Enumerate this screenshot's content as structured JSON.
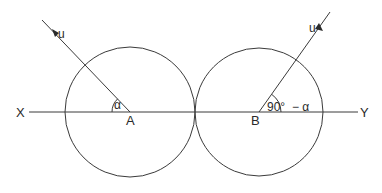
{
  "diagram": {
    "type": "geometry-projectile",
    "line_labels": {
      "left": "X",
      "right": "Y"
    },
    "points": {
      "A": {
        "label": "A",
        "x": 130,
        "y": 112
      },
      "B": {
        "label": "B",
        "x": 259,
        "y": 112
      }
    },
    "circles": [
      {
        "name": "circle-A",
        "cx": 130,
        "cy": 112,
        "r": 65
      },
      {
        "name": "circle-B",
        "cx": 259,
        "cy": 112,
        "r": 64
      }
    ],
    "velocity_labels": {
      "left": "u",
      "right": "u"
    },
    "angles": {
      "left": "α",
      "right_number": "90°",
      "right_suffix": "− α"
    },
    "colors": {
      "stroke": "#3a3a3a",
      "text": "#2a2a2a",
      "background": "#ffffff"
    }
  }
}
